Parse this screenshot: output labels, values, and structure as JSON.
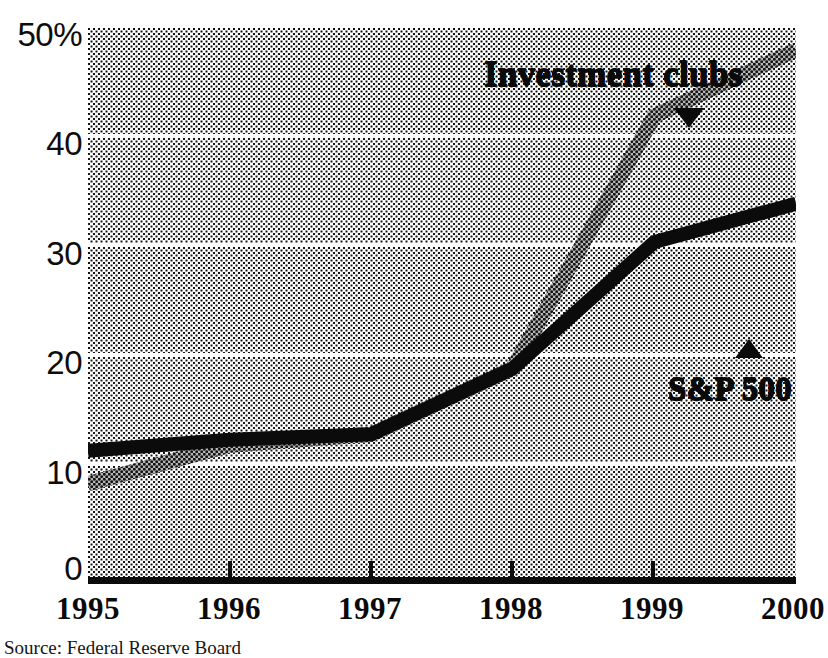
{
  "chart_data": {
    "type": "line",
    "title": "",
    "subtitle": "",
    "xlabel": "",
    "ylabel": "",
    "x": [
      "1995",
      "1996",
      "1997",
      "1998",
      "1999",
      "2000"
    ],
    "categories": [
      "1995",
      "1996",
      "1997",
      "1998",
      "1999",
      "2000"
    ],
    "series": [
      {
        "name": "Investment clubs",
        "values": [
          8.5,
          12.0,
          13.0,
          19.0,
          42.0,
          48.0
        ],
        "marker": "triangle-down",
        "style": "halftone-thick"
      },
      {
        "name": "S&P 500",
        "values": [
          11.5,
          12.5,
          13.0,
          19.0,
          30.5,
          34.0
        ],
        "marker": "triangle-up",
        "style": "solid-thick"
      }
    ],
    "ylim": [
      0,
      50
    ],
    "xlim": [
      "1995",
      "2000"
    ],
    "y_ticks": [
      "0",
      "10",
      "20",
      "30",
      "40",
      "50%"
    ],
    "y_tick_values": [
      0,
      10,
      20,
      30,
      40,
      50
    ],
    "x_ticks": [
      "1995",
      "1996",
      "1997",
      "1998",
      "1999",
      "2000"
    ],
    "grid": true,
    "grid_orientation": "horizontal",
    "legend": "inline-annotations",
    "legend_position": "inside-plot",
    "background": "halftone-banded"
  },
  "axes": {
    "y_labels": [
      {
        "text": "50%",
        "value": 50
      },
      {
        "text": "40",
        "value": 40
      },
      {
        "text": "30",
        "value": 30
      },
      {
        "text": "20",
        "value": 20
      },
      {
        "text": "10",
        "value": 10
      },
      {
        "text": "0",
        "value": 0
      }
    ],
    "x_labels": [
      {
        "text": "1995",
        "value": 1995
      },
      {
        "text": "1996",
        "value": 1996
      },
      {
        "text": "1997",
        "value": 1997
      },
      {
        "text": "1998",
        "value": 1998
      },
      {
        "text": "1999",
        "value": 1999
      },
      {
        "text": "2000",
        "value": 2000
      }
    ]
  },
  "annotations": {
    "investment_clubs": {
      "label": "Investment clubs",
      "marker_icon": "triangle-down-icon"
    },
    "sp500": {
      "label": "S&P 500",
      "marker_icon": "triangle-up-icon"
    }
  },
  "footer": {
    "source": "Source: Federal Reserve Board"
  },
  "colors": {
    "ink": "#0a0a0a",
    "paper": "#ffffff",
    "gridline": "#ffffff",
    "series_investment_clubs": "#141414",
    "series_sp500": "#0b0b0b"
  }
}
